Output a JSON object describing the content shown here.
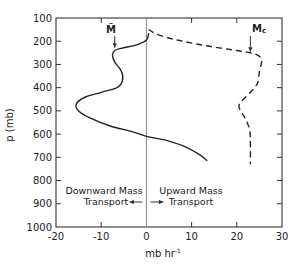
{
  "chart_data": {
    "type": "line",
    "title": "",
    "xlabel": "mb hr⁻¹",
    "xlabel_base": "mb hr",
    "xlabel_sup": "-1",
    "ylabel": "p (mb)",
    "xlim": [
      -20,
      30
    ],
    "ylim": [
      1000,
      100
    ],
    "y_inverted": true,
    "grid": false,
    "x_ticks": [
      -20,
      -10,
      0,
      10,
      20,
      30
    ],
    "x_tick_labels": [
      "-20",
      "-10",
      "0",
      "10",
      "20",
      "30"
    ],
    "y_ticks": [
      100,
      200,
      300,
      400,
      500,
      600,
      700,
      800,
      900,
      1000
    ],
    "y_tick_labels": [
      "100",
      "200",
      "300",
      "400",
      "500",
      "600",
      "700",
      "800",
      "900",
      "1000"
    ],
    "zero_line": true,
    "series": [
      {
        "name": "M̃",
        "label": "M̃",
        "style": "solid",
        "color": "#222222",
        "points": [
          {
            "x": 0.5,
            "p": 165
          },
          {
            "x": 0.0,
            "p": 195
          },
          {
            "x": -2.0,
            "p": 215
          },
          {
            "x": -5.0,
            "p": 228
          },
          {
            "x": -7.0,
            "p": 240
          },
          {
            "x": -7.5,
            "p": 260
          },
          {
            "x": -7.0,
            "p": 290
          },
          {
            "x": -5.5,
            "p": 330
          },
          {
            "x": -5.3,
            "p": 370
          },
          {
            "x": -6.5,
            "p": 400
          },
          {
            "x": -10.0,
            "p": 420
          },
          {
            "x": -13.5,
            "p": 440
          },
          {
            "x": -15.5,
            "p": 470
          },
          {
            "x": -15.0,
            "p": 500
          },
          {
            "x": -12.5,
            "p": 530
          },
          {
            "x": -8.0,
            "p": 565
          },
          {
            "x": -3.0,
            "p": 590
          },
          {
            "x": 0.0,
            "p": 610
          },
          {
            "x": 4.0,
            "p": 625
          },
          {
            "x": 8.0,
            "p": 650
          },
          {
            "x": 11.5,
            "p": 685
          },
          {
            "x": 13.5,
            "p": 715
          }
        ]
      },
      {
        "name": "M_c",
        "label": "M",
        "label_sub": "c",
        "style": "dashed",
        "color": "#222222",
        "points": [
          {
            "x": 0.5,
            "p": 150
          },
          {
            "x": 3.0,
            "p": 175
          },
          {
            "x": 8.0,
            "p": 200
          },
          {
            "x": 14.0,
            "p": 222
          },
          {
            "x": 20.0,
            "p": 240
          },
          {
            "x": 23.0,
            "p": 250
          },
          {
            "x": 24.8,
            "p": 262
          },
          {
            "x": 25.5,
            "p": 285
          },
          {
            "x": 25.0,
            "p": 330
          },
          {
            "x": 24.6,
            "p": 380
          },
          {
            "x": 23.0,
            "p": 420
          },
          {
            "x": 21.0,
            "p": 460
          },
          {
            "x": 20.5,
            "p": 485
          },
          {
            "x": 21.8,
            "p": 530
          },
          {
            "x": 22.8,
            "p": 580
          },
          {
            "x": 23.0,
            "p": 640
          },
          {
            "x": 23.0,
            "p": 730
          }
        ]
      }
    ],
    "annotations": [
      {
        "text": "M̃",
        "arrow_to": {
          "x": -7.0,
          "p": 240
        },
        "label_at": {
          "x": -7.0,
          "p": 145
        }
      },
      {
        "text": "Mc",
        "arrow_to": {
          "x": 23.0,
          "p": 250
        },
        "label_at": {
          "x": 23.0,
          "p": 145
        }
      },
      {
        "text": "Downward Mass Transport",
        "lines": [
          "Downward Mass",
          "Transport"
        ],
        "arrow": "left"
      },
      {
        "text": "Upward Mass Transport",
        "lines": [
          "Upward Mass",
          "Transport"
        ],
        "arrow": "right"
      }
    ]
  },
  "labels": {
    "ylabel": "p (mb)",
    "xlabel_base": "mb hr",
    "xlabel_sup": "-1",
    "mtilde": "M̃",
    "mc_base": "M",
    "mc_sub": "c",
    "down_line1": "Downward Mass",
    "down_line2": "Transport",
    "up_line1": "Upward Mass",
    "up_line2": "Transport"
  }
}
